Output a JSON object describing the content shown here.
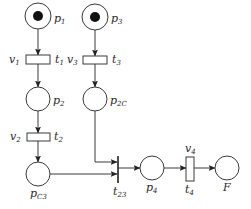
{
  "diagram": {
    "type": "petri-net",
    "places": [
      {
        "id": "p1",
        "label": "p",
        "sub": "1",
        "tokens": 1
      },
      {
        "id": "p3",
        "label": "p",
        "sub": "3",
        "tokens": 1
      },
      {
        "id": "p2",
        "label": "p",
        "sub": "2",
        "tokens": 0
      },
      {
        "id": "p2C",
        "label": "p",
        "sub": "2C",
        "tokens": 0
      },
      {
        "id": "pC3",
        "label": "p",
        "sub": "C3",
        "tokens": 0
      },
      {
        "id": "p4",
        "label": "p",
        "sub": "4",
        "tokens": 0
      },
      {
        "id": "F",
        "label": "F",
        "sub": "",
        "tokens": 0
      }
    ],
    "transitions": [
      {
        "id": "t1",
        "label": "t",
        "sub": "1",
        "weight_label": "v",
        "weight_sub": "1"
      },
      {
        "id": "t3",
        "label": "t",
        "sub": "3",
        "weight_label": "v",
        "weight_sub": "3"
      },
      {
        "id": "t2",
        "label": "t",
        "sub": "2",
        "weight_label": "v",
        "weight_sub": "2"
      },
      {
        "id": "t23",
        "label": "t",
        "sub": "23",
        "weight_label": "",
        "weight_sub": ""
      },
      {
        "id": "t4",
        "label": "t",
        "sub": "4",
        "weight_label": "v",
        "weight_sub": "4"
      }
    ],
    "arcs": [
      {
        "from": "p1",
        "to": "t1"
      },
      {
        "from": "t1",
        "to": "p2"
      },
      {
        "from": "p2",
        "to": "t2"
      },
      {
        "from": "t2",
        "to": "pC3"
      },
      {
        "from": "p3",
        "to": "t3"
      },
      {
        "from": "t3",
        "to": "p2C"
      },
      {
        "from": "p2C",
        "to": "t23"
      },
      {
        "from": "pC3",
        "to": "t23"
      },
      {
        "from": "t23",
        "to": "p4"
      },
      {
        "from": "p4",
        "to": "t4"
      },
      {
        "from": "t4",
        "to": "F"
      }
    ]
  }
}
